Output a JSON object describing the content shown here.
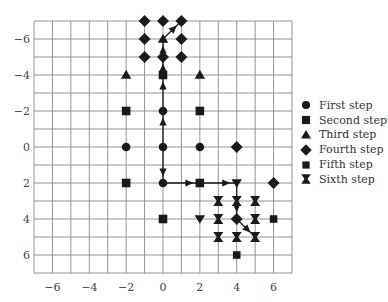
{
  "chart_data": {
    "type": "scatter",
    "title": "",
    "xlabel": "",
    "ylabel": "",
    "xlim": [
      -7,
      7
    ],
    "ylim": [
      -7,
      7
    ],
    "y_inverted": true,
    "grid": true,
    "x_ticks": [
      -6,
      -4,
      -2,
      0,
      2,
      4,
      6
    ],
    "y_ticks": [
      -6,
      -4,
      -2,
      0,
      2,
      4,
      6
    ],
    "x_tick_labels": [
      "−6",
      "−4",
      "−2",
      "0",
      "2",
      "4",
      "6"
    ],
    "y_tick_labels": [
      "−6",
      "−4",
      "−2",
      "0",
      "2",
      "4",
      "6"
    ],
    "legend_position": "right",
    "series": [
      {
        "name": "First step",
        "marker": "circle",
        "points": [
          [
            -2,
            0
          ],
          [
            0,
            0
          ],
          [
            2,
            0
          ],
          [
            0,
            -2
          ],
          [
            0,
            2
          ]
        ]
      },
      {
        "name": "Second step",
        "marker": "square",
        "points": [
          [
            -2,
            -2
          ],
          [
            2,
            -2
          ],
          [
            -2,
            2
          ],
          [
            2,
            2
          ],
          [
            0,
            -4
          ],
          [
            0,
            4
          ]
        ]
      },
      {
        "name": "Third step",
        "marker": "triangle",
        "points": [
          [
            -2,
            -4
          ],
          [
            2,
            -4
          ],
          [
            0,
            -6
          ],
          [
            2,
            4
          ],
          [
            4,
            2
          ]
        ]
      },
      {
        "name": "Fourth step",
        "marker": "diamond",
        "points": [
          [
            -1,
            -7
          ],
          [
            0,
            -7
          ],
          [
            1,
            -7
          ],
          [
            -1,
            -6
          ],
          [
            1,
            -6
          ],
          [
            -1,
            -5
          ],
          [
            0,
            -5
          ],
          [
            1,
            -5
          ],
          [
            4,
            0
          ],
          [
            6,
            2
          ],
          [
            4,
            4
          ]
        ]
      },
      {
        "name": "Fifth step",
        "marker": "small-square",
        "points": [
          [
            6,
            4
          ],
          [
            4,
            6
          ]
        ]
      },
      {
        "name": "Sixth step",
        "marker": "bowtie",
        "points": [
          [
            3,
            3
          ],
          [
            4,
            3
          ],
          [
            5,
            3
          ],
          [
            3,
            4
          ],
          [
            5,
            4
          ],
          [
            3,
            5
          ],
          [
            4,
            5
          ],
          [
            5,
            5
          ]
        ]
      }
    ],
    "arrows": [
      [
        [
          0,
          0
        ],
        [
          0,
          -2
        ]
      ],
      [
        [
          0,
          -2
        ],
        [
          0,
          -4
        ]
      ],
      [
        [
          0,
          -4
        ],
        [
          0,
          -5
        ]
      ],
      [
        [
          0,
          -5
        ],
        [
          0,
          -6
        ]
      ],
      [
        [
          0,
          -6
        ],
        [
          1,
          -7
        ]
      ],
      [
        [
          0,
          0
        ],
        [
          0,
          2
        ]
      ],
      [
        [
          0,
          2
        ],
        [
          2,
          2
        ]
      ],
      [
        [
          2,
          2
        ],
        [
          4,
          2
        ]
      ],
      [
        [
          4,
          2
        ],
        [
          4,
          4
        ]
      ],
      [
        [
          4,
          4
        ],
        [
          5,
          5
        ]
      ]
    ]
  },
  "legend": {
    "items": [
      {
        "label": "First step",
        "marker": "circle"
      },
      {
        "label": "Second step",
        "marker": "square"
      },
      {
        "label": "Third step",
        "marker": "triangle"
      },
      {
        "label": "Fourth step",
        "marker": "diamond"
      },
      {
        "label": "Fifth step",
        "marker": "small-square"
      },
      {
        "label": "Sixth step",
        "marker": "bowtie"
      }
    ]
  },
  "colors": {
    "marker": "#1a1a1a",
    "grid": "#888888",
    "text": "#444444"
  }
}
